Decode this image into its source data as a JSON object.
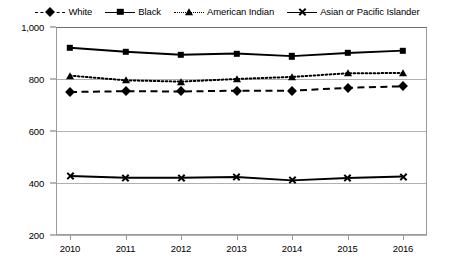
{
  "chart_data": {
    "type": "line",
    "title": "",
    "xlabel": "",
    "ylabel": "",
    "categories": [
      "2010",
      "2011",
      "2012",
      "2013",
      "2014",
      "2015",
      "2016"
    ],
    "x": [
      2010,
      2011,
      2012,
      2013,
      2014,
      2015,
      2016
    ],
    "ylim": [
      200,
      1000
    ],
    "yticks": [
      200,
      400,
      600,
      800,
      1000
    ],
    "ytick_labels": [
      "200",
      "400",
      "600",
      "800",
      "1,000"
    ],
    "grid": true,
    "legend_position": "top-center",
    "series": [
      {
        "name": "White",
        "marker": "diamond",
        "line_style": "dashed",
        "color": "#000000",
        "values": [
          750,
          753,
          752,
          755,
          755,
          766,
          772
        ]
      },
      {
        "name": "Black",
        "marker": "square",
        "line_style": "solid",
        "color": "#000000",
        "values": [
          920,
          905,
          893,
          898,
          888,
          900,
          909
        ]
      },
      {
        "name": "American Indian",
        "marker": "triangle",
        "line_style": "dotted",
        "color": "#000000",
        "values": [
          813,
          795,
          790,
          800,
          808,
          822,
          823
        ]
      },
      {
        "name": "Asian or Pacific Islander",
        "marker": "x",
        "line_style": "solid",
        "color": "#000000",
        "values": [
          427,
          420,
          420,
          423,
          410,
          419,
          425
        ]
      }
    ]
  }
}
